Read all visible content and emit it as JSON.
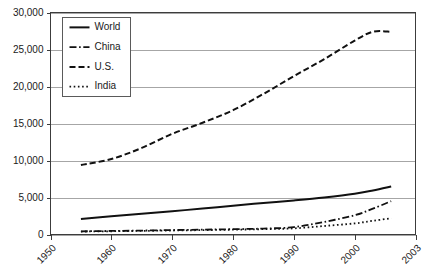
{
  "chart_data": {
    "type": "line",
    "title": "",
    "subtitle": "",
    "xlabel": "",
    "ylabel": "",
    "xlim": [
      1950,
      2010
    ],
    "ylim": [
      0,
      30000
    ],
    "grid": true,
    "legend_position": "top-left",
    "x_tick_labels": [
      "1950",
      "1960",
      "1970",
      "1980",
      "1990",
      "2000",
      "2003"
    ],
    "x_tick_values": [
      1950,
      1960,
      1970,
      1980,
      1990,
      2000,
      2010
    ],
    "y_tick_labels": [
      "0",
      "5,000",
      "10,000",
      "15,000",
      "20,000",
      "25,000",
      "30,000"
    ],
    "y_tick_values": [
      0,
      5000,
      10000,
      15000,
      20000,
      25000,
      30000
    ],
    "series": [
      {
        "name": "World",
        "dash": "solid",
        "color": "#111111",
        "width": 2.0,
        "x": [
          1955,
          1960,
          1965,
          1970,
          1975,
          1980,
          1985,
          1990,
          1995,
          2000,
          2003,
          2006
        ],
        "values": [
          2100,
          2450,
          2800,
          3150,
          3500,
          3900,
          4250,
          4600,
          5000,
          5500,
          5950,
          6500
        ]
      },
      {
        "name": "China",
        "dash": "dashdot",
        "color": "#111111",
        "width": 1.8,
        "x": [
          1955,
          1960,
          1965,
          1970,
          1975,
          1980,
          1985,
          1990,
          1995,
          2000,
          2003,
          2006
        ],
        "values": [
          430,
          480,
          530,
          600,
          660,
          720,
          800,
          1000,
          1700,
          2600,
          3500,
          4500
        ]
      },
      {
        "name": "U.S.",
        "dash": "dashed",
        "color": "#111111",
        "width": 2.0,
        "x": [
          1955,
          1960,
          1965,
          1970,
          1975,
          1980,
          1985,
          1990,
          1995,
          2000,
          2003,
          2006
        ],
        "values": [
          9400,
          10200,
          11700,
          13600,
          15100,
          16800,
          19000,
          21400,
          23700,
          26200,
          27400,
          27400
        ]
      },
      {
        "name": "India",
        "dash": "dotted",
        "color": "#111111",
        "width": 1.8,
        "x": [
          1955,
          1960,
          1965,
          1970,
          1975,
          1980,
          1985,
          1990,
          1995,
          2000,
          2003,
          2006
        ],
        "values": [
          400,
          440,
          490,
          540,
          590,
          650,
          720,
          830,
          1150,
          1500,
          1850,
          2200
        ]
      }
    ]
  },
  "legend": {
    "items": [
      {
        "label": "World"
      },
      {
        "label": "China"
      },
      {
        "label": "U.S."
      },
      {
        "label": "India"
      }
    ]
  }
}
